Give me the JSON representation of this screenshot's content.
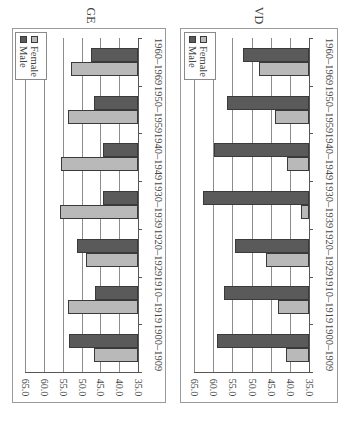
{
  "orientation": "rotated 90deg clockwise",
  "colors": {
    "male": "#5a5a5a",
    "female": "#b9b9b9",
    "grid": "#8c8c8c"
  },
  "legend": {
    "female_label": "Female",
    "male_label": "Male"
  },
  "charts": [
    {
      "title": "GE"
    },
    {
      "title": "VD"
    }
  ],
  "y_ticks": [
    "65.0",
    "60.0",
    "55.0",
    "50.0",
    "45.0",
    "40.0",
    "35.0"
  ],
  "categories": [
    "1900–1909",
    "1910–1919",
    "1920–1929",
    "1930–1939",
    "1940–1949",
    "1950–1959",
    "1960–1969"
  ],
  "chart_data": [
    {
      "type": "bar",
      "title": "GE",
      "categories": [
        "1900–1909",
        "1910–1919",
        "1920–1929",
        "1930–1939",
        "1940–1949",
        "1950–1959",
        "1960–1969"
      ],
      "series": [
        {
          "name": "Female",
          "values": [
            46.8,
            53.5,
            48.7,
            55.8,
            55.5,
            53.5,
            52.9
          ]
        },
        {
          "name": "Male",
          "values": [
            53.2,
            46.5,
            51.3,
            44.3,
            44.4,
            46.8,
            47.4
          ]
        }
      ],
      "xlabel": "",
      "ylabel": "",
      "ylim": [
        35,
        65
      ],
      "yticks": [
        35,
        40,
        45,
        50,
        55,
        60,
        65
      ],
      "grid": true,
      "legend_position": "top-left (rotated)"
    },
    {
      "type": "bar",
      "title": "VD",
      "categories": [
        "1900–1909",
        "1910–1919",
        "1920–1929",
        "1930–1939",
        "1940–1949",
        "1950–1959",
        "1960–1969"
      ],
      "series": [
        {
          "name": "Female",
          "values": [
            41.1,
            43.2,
            46.1,
            37.2,
            40.7,
            43.8,
            48.1
          ]
        },
        {
          "name": "Male",
          "values": [
            59.0,
            57.1,
            54.2,
            62.6,
            59.7,
            56.5,
            52.3
          ]
        }
      ],
      "xlabel": "",
      "ylabel": "",
      "ylim": [
        35,
        65
      ],
      "yticks": [
        35,
        40,
        45,
        50,
        55,
        60,
        65
      ],
      "grid": true,
      "legend_position": "top-left (rotated)"
    }
  ]
}
